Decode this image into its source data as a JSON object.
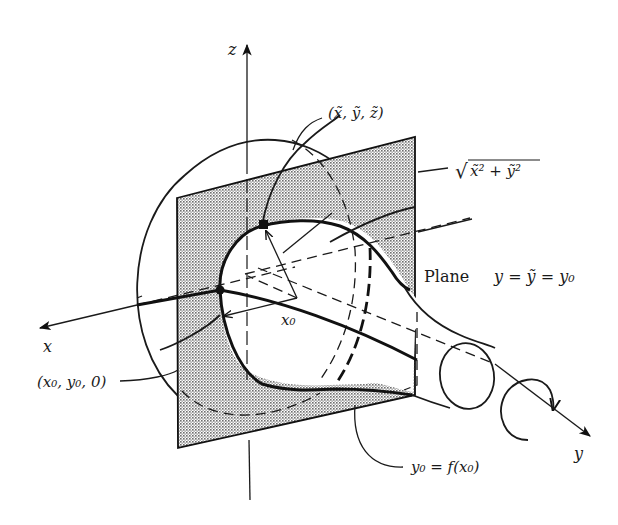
{
  "figure": {
    "axes": {
      "x_label": "x",
      "y_label": "y",
      "z_label": "z"
    },
    "labels": {
      "point_tilde": "(x̃, ỹ, z̃)",
      "radius_expr_sqrt": "√",
      "radius_expr": "x̃² + ỹ²",
      "plane_word": "Plane",
      "plane_eq": "y = ỹ = y₀",
      "x0": "x₀",
      "point_base": "(x₀, y₀, 0)",
      "curve_eq": "y₀ = f(x₀)"
    },
    "colors": {
      "ink": "#1a1a1a",
      "plane_shade": "#bdbdbd",
      "background": "#ffffff"
    }
  }
}
